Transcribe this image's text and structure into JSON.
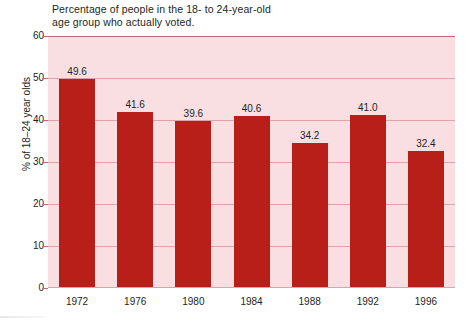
{
  "chart_data": {
    "type": "bar",
    "title": "Percentage of people in the 18- to 24-year-old\nage group who actually voted.",
    "xlabel": "",
    "ylabel": "% of 18–24 year olds",
    "categories": [
      "1972",
      "1976",
      "1980",
      "1984",
      "1988",
      "1992",
      "1996"
    ],
    "values": [
      49.6,
      41.6,
      39.6,
      40.6,
      34.2,
      41.0,
      32.4
    ],
    "value_labels": [
      "49.6",
      "41.6",
      "39.6",
      "40.6",
      "34.2",
      "41.0",
      "32.4"
    ],
    "ylim": [
      0,
      60
    ],
    "yticks": [
      0,
      10,
      20,
      30,
      40,
      50,
      60
    ],
    "ytick_labels": [
      "0",
      "10",
      "20",
      "30",
      "40",
      "50",
      "60"
    ],
    "grid": true,
    "grid_axis": "y",
    "legend": false,
    "legend_position": "none",
    "colors": {
      "bar": "#b81f18",
      "plot_background": "#f9dfe2",
      "gridline": "#e2a0aa",
      "top_gridline": "#c2687a",
      "text": "#231f20",
      "page_background": "#ffffff"
    }
  }
}
